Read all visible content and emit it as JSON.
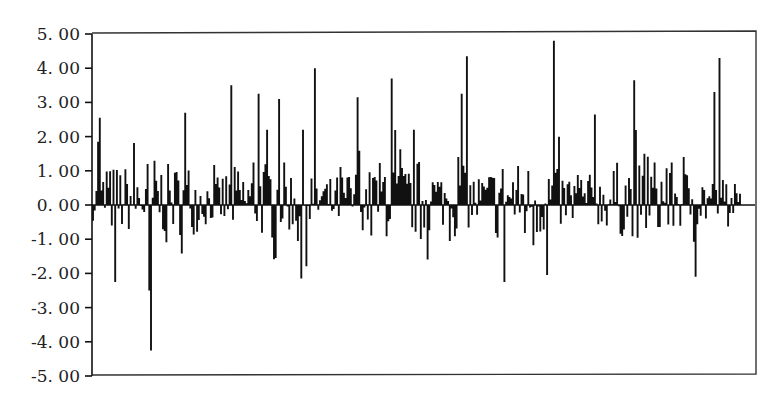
{
  "chart_data": {
    "type": "bar",
    "title": "",
    "xlabel": "",
    "ylabel": "",
    "ylim": [
      -5,
      5
    ],
    "yticks": [
      5,
      4,
      3,
      2,
      1,
      0,
      -1,
      -2,
      -3,
      -4,
      -5
    ],
    "ytick_labels": [
      "5. 00",
      "4. 00",
      "3. 00",
      "2. 00",
      "1. 00",
      "0. 00",
      "-1. 00",
      "-2. 00",
      "-3. 00",
      "-4. 00",
      "-5. 00"
    ],
    "grid": false,
    "legend": null,
    "frame": true,
    "line_color": "#111111",
    "notable_points": [
      {
        "x": 3,
        "value": 1.85
      },
      {
        "x": 4,
        "value": 2.55
      },
      {
        "x": 13,
        "value": -2.25
      },
      {
        "x": 33,
        "value": -2.5
      },
      {
        "x": 34,
        "value": -4.25
      },
      {
        "x": 54,
        "value": 2.7
      },
      {
        "x": 81,
        "value": 3.5
      },
      {
        "x": 97,
        "value": 3.25
      },
      {
        "x": 109,
        "value": 3.1
      },
      {
        "x": 122,
        "value": -2.15
      },
      {
        "x": 130,
        "value": 4.0
      },
      {
        "x": 155,
        "value": 3.15
      },
      {
        "x": 175,
        "value": 3.7
      },
      {
        "x": 216,
        "value": 3.25
      },
      {
        "x": 219,
        "value": 4.35
      },
      {
        "x": 241,
        "value": -2.25
      },
      {
        "x": 266,
        "value": -2.05
      },
      {
        "x": 270,
        "value": 4.8
      },
      {
        "x": 294,
        "value": 2.65
      },
      {
        "x": 317,
        "value": 3.65
      },
      {
        "x": 353,
        "value": -2.1
      },
      {
        "x": 364,
        "value": 3.3
      },
      {
        "x": 367,
        "value": 4.3
      },
      {
        "x": 372,
        "value": -2.1
      }
    ],
    "x_px_start": 93,
    "x_px_end": 740,
    "n_points": 380,
    "seed": 7
  }
}
